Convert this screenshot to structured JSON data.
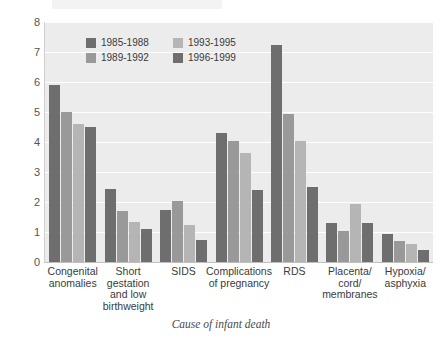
{
  "chart_data": {
    "type": "bar",
    "title": "",
    "xlabel": "Cause of infant death",
    "ylabel": "",
    "ylim": [
      0,
      8
    ],
    "yticks": [
      0,
      1,
      2,
      3,
      4,
      5,
      6,
      7,
      8
    ],
    "grid": true,
    "legend_position": "top-left-inside",
    "categories": [
      "Congenital anomalies",
      "Short gestation and low birthweight",
      "SIDS",
      "Complications of pregnancy",
      "RDS",
      "Placenta/ cord/ membranes",
      "Hypoxia/ asphyxia"
    ],
    "category_lines": [
      [
        "Congenital",
        "anomalies"
      ],
      [
        "Short",
        "gestation",
        "and low",
        "birthweight"
      ],
      [
        "SIDS"
      ],
      [
        "Complications",
        "of pregnancy"
      ],
      [
        "RDS"
      ],
      [
        "Placenta/",
        "cord/",
        "membranes"
      ],
      [
        "Hypoxia/",
        "asphyxia"
      ]
    ],
    "series": [
      {
        "name": "1985-1988",
        "color": "#6e6e6e",
        "values": [
          5.9,
          2.45,
          1.75,
          4.3,
          7.25,
          1.3,
          0.95
        ]
      },
      {
        "name": "1989-1992",
        "color": "#999999",
        "values": [
          5.0,
          1.7,
          2.05,
          4.05,
          4.95,
          1.05,
          0.7
        ]
      },
      {
        "name": "1993-1995",
        "color": "#b5b5b5",
        "values": [
          4.6,
          1.35,
          1.25,
          3.65,
          4.05,
          1.95,
          0.6
        ]
      },
      {
        "name": "1996-1999",
        "color": "#6e6e6e",
        "values": [
          4.5,
          1.1,
          0.75,
          2.4,
          2.5,
          1.3,
          0.4
        ]
      }
    ]
  },
  "legend": {
    "entries": [
      {
        "label": "1985-1988",
        "color": "#6e6e6e"
      },
      {
        "label": "1993-1995",
        "color": "#b5b5b5"
      },
      {
        "label": "1989-1992",
        "color": "#999999"
      },
      {
        "label": "1996-1999",
        "color": "#6e6e6e"
      }
    ]
  },
  "axes": {
    "x_title": "Cause of infant death",
    "y_ticks": [
      "8",
      "7",
      "6",
      "5",
      "4",
      "3",
      "2",
      "1",
      "0"
    ]
  },
  "colors": {
    "plot_background": "#ececec",
    "gridline": "#ffffff",
    "page_background": "#ffffff",
    "text": "#3a3a3a"
  }
}
